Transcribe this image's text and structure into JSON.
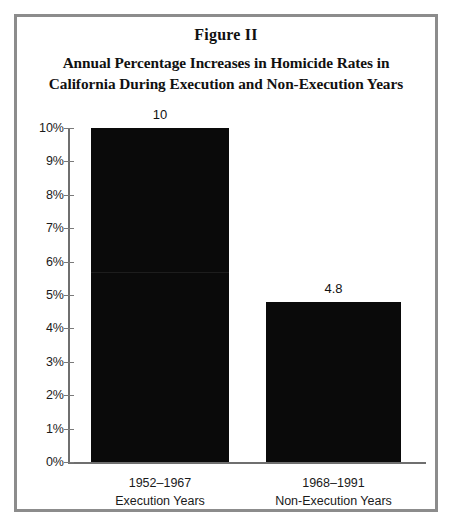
{
  "figure": {
    "label": "Figure II",
    "title_line1": "Annual Percentage Increases in Homicide Rates in",
    "title_line2": "California During Execution and Non-Execution Years"
  },
  "chart_data": {
    "type": "bar",
    "title": "Annual Percentage Increases in Homicide Rates in California During Execution and Non-Execution Years",
    "subtitle": "Figure II",
    "xlabel": "",
    "ylabel": "",
    "ylim": [
      0,
      10
    ],
    "grid": false,
    "legend": "none",
    "categories": [
      "1952–1967",
      "1968–1991"
    ],
    "category_sublabels": [
      "Execution Years",
      "Non-Execution Years"
    ],
    "values": [
      10,
      4.8
    ],
    "value_labels": [
      "10",
      "4.8"
    ],
    "ytick_values": [
      0,
      1,
      2,
      3,
      4,
      5,
      6,
      7,
      8,
      9,
      10
    ],
    "ytick_labels": [
      "0%",
      "1%",
      "2%",
      "3%",
      "4%",
      "5%",
      "6%",
      "7%",
      "8%",
      "9%",
      "10%"
    ],
    "bar_color": "#0a0a0a",
    "axis_color": "#6f6f6f",
    "frame_color": "#8c8c8c",
    "background_color": "#ffffff"
  }
}
